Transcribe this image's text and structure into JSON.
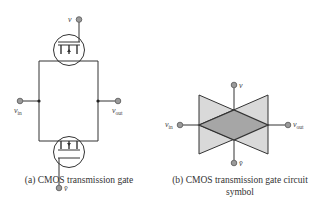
{
  "figure": {
    "left": {
      "caption": "(a) CMOS transmission gate",
      "labels": {
        "v": "v",
        "v_bar": "v̄",
        "v_in_main": "v",
        "v_in_sub": "in",
        "v_out_main": "v",
        "v_out_sub": "out"
      }
    },
    "right": {
      "caption_line1": "(b) CMOS transmission gate circuit",
      "caption_line2": "symbol",
      "labels": {
        "v": "v",
        "v_bar": "v̄",
        "v_in_main": "v",
        "v_in_sub": "in",
        "v_out_main": "v",
        "v_out_sub": "out"
      }
    }
  },
  "colors": {
    "wire": "#333333",
    "terminal_fill": "#9a9a9a",
    "triangle_fill": "#d9d9d9",
    "diamond_fill": "#a6a6a6"
  }
}
